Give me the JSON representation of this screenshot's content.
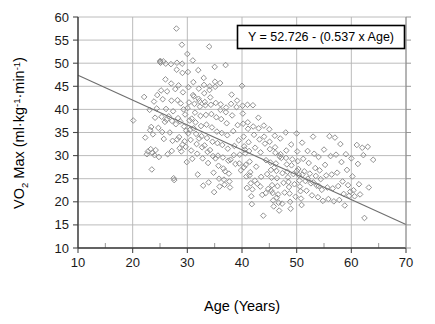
{
  "chart_data": {
    "type": "scatter",
    "title": "",
    "xlabel": "Age (Years)",
    "ylabel": "VO2 Max (ml·kg-1·min-1)",
    "ylabel_parts": {
      "lead": "VO",
      "sub": "2",
      "mid": " Max (ml·kg",
      "sup1": "-1",
      "mid2": "·min",
      "sup2": "-1",
      "tail": ")"
    },
    "xlim": [
      10,
      70
    ],
    "ylim": [
      10,
      60
    ],
    "xticks": [
      10,
      20,
      30,
      40,
      50,
      60,
      70
    ],
    "yticks": [
      10,
      15,
      20,
      25,
      30,
      35,
      40,
      45,
      50,
      55,
      60
    ],
    "xticklabels": [
      "10",
      "20",
      "30",
      "40",
      "50",
      "60",
      "70"
    ],
    "yticklabels": [
      "10",
      "15",
      "20",
      "25",
      "30",
      "35",
      "40",
      "45",
      "50",
      "55",
      "60"
    ],
    "x_minor_tick_step": 5,
    "grid": {
      "x": true,
      "y": true,
      "color": "#b4b4b4"
    },
    "legend": {
      "position": "top-right",
      "boxed": true
    },
    "marker": {
      "shape": "diamond",
      "filled": false,
      "color": "#8a8a8a",
      "size": 5.6
    },
    "annotation": {
      "text": "Y = 52.726 - (0.537 x Age)",
      "intercept": 52.726,
      "slope": -0.537,
      "box": true
    },
    "trendline": {
      "type": "linear",
      "intercept": 52.726,
      "slope": -0.537,
      "x_start": 10,
      "x_end": 70,
      "y_start": 47.4,
      "y_end": 15.1,
      "color": "#6e6e6e"
    },
    "n_points": 343,
    "points": [
      [
        20.1,
        37.6
      ],
      [
        22.1,
        42.7
      ],
      [
        22.3,
        33.9
      ],
      [
        22.6,
        30.3
      ],
      [
        22.8,
        30.9
      ],
      [
        23.1,
        39.9
      ],
      [
        23.2,
        35.5
      ],
      [
        23.3,
        31.4
      ],
      [
        23.4,
        36.2
      ],
      [
        23.5,
        27.0
      ],
      [
        23.6,
        30.6
      ],
      [
        23.7,
        34.6
      ],
      [
        23.9,
        41.7
      ],
      [
        24.0,
        30.1
      ],
      [
        24.1,
        38.2
      ],
      [
        24.2,
        31.2
      ],
      [
        24.4,
        40.2
      ],
      [
        24.5,
        43.1
      ],
      [
        24.7,
        36.0
      ],
      [
        24.8,
        29.7
      ],
      [
        25.0,
        50.3
      ],
      [
        25.1,
        50.1
      ],
      [
        25.2,
        44.1
      ],
      [
        25.3,
        38.4
      ],
      [
        25.4,
        35.1
      ],
      [
        25.5,
        42.2
      ],
      [
        25.6,
        50.4
      ],
      [
        25.7,
        33.6
      ],
      [
        25.9,
        37.3
      ],
      [
        26.0,
        46.5
      ],
      [
        26.1,
        40.1
      ],
      [
        26.2,
        37.8
      ],
      [
        26.3,
        43.9
      ],
      [
        26.4,
        30.3
      ],
      [
        26.6,
        38.5
      ],
      [
        26.8,
        35.0
      ],
      [
        27.0,
        49.8
      ],
      [
        27.1,
        41.9
      ],
      [
        27.2,
        37.5
      ],
      [
        27.3,
        33.2
      ],
      [
        27.4,
        39.6
      ],
      [
        27.5,
        25.1
      ],
      [
        27.6,
        24.7
      ],
      [
        27.8,
        44.4
      ],
      [
        27.9,
        36.8
      ],
      [
        28.0,
        57.5
      ],
      [
        28.1,
        50.1
      ],
      [
        28.2,
        42.0
      ],
      [
        28.3,
        38.1
      ],
      [
        28.4,
        45.2
      ],
      [
        28.5,
        34.0
      ],
      [
        28.6,
        31.6
      ],
      [
        28.7,
        37.4
      ],
      [
        28.8,
        41.3
      ],
      [
        28.9,
        30.9
      ],
      [
        29.0,
        54.0
      ],
      [
        29.1,
        47.9
      ],
      [
        29.2,
        43.7
      ],
      [
        29.3,
        40.0
      ],
      [
        29.4,
        36.3
      ],
      [
        29.5,
        33.1
      ],
      [
        29.6,
        38.9
      ],
      [
        29.7,
        31.9
      ],
      [
        29.8,
        35.4
      ],
      [
        29.9,
        28.6
      ],
      [
        30.0,
        52.0
      ],
      [
        30.1,
        48.1
      ],
      [
        30.2,
        44.8
      ],
      [
        30.3,
        41.5
      ],
      [
        30.4,
        37.6
      ],
      [
        30.5,
        35.6
      ],
      [
        30.6,
        33.4
      ],
      [
        30.7,
        31.1
      ],
      [
        30.8,
        38.0
      ],
      [
        30.9,
        29.3
      ],
      [
        31.0,
        50.6
      ],
      [
        31.1,
        45.9
      ],
      [
        31.2,
        42.8
      ],
      [
        31.3,
        41.2
      ],
      [
        31.4,
        39.3
      ],
      [
        31.5,
        37.2
      ],
      [
        31.6,
        34.7
      ],
      [
        31.7,
        32.5
      ],
      [
        31.8,
        30.4
      ],
      [
        31.9,
        25.9
      ],
      [
        32.0,
        48.5
      ],
      [
        32.1,
        44.5
      ],
      [
        32.2,
        41.8
      ],
      [
        32.3,
        40.6
      ],
      [
        32.4,
        38.6
      ],
      [
        32.5,
        36.4
      ],
      [
        32.6,
        34.2
      ],
      [
        32.7,
        31.8
      ],
      [
        32.8,
        29.4
      ],
      [
        32.9,
        23.5
      ],
      [
        33.0,
        46.8
      ],
      [
        33.1,
        43.5
      ],
      [
        33.2,
        41.6
      ],
      [
        33.3,
        40.9
      ],
      [
        33.4,
        38.8
      ],
      [
        33.5,
        36.7
      ],
      [
        33.6,
        33.8
      ],
      [
        33.7,
        30.8
      ],
      [
        33.8,
        28.4
      ],
      [
        33.9,
        24.2
      ],
      [
        34.0,
        53.6
      ],
      [
        34.1,
        45.0
      ],
      [
        34.2,
        42.6
      ],
      [
        34.3,
        41.0
      ],
      [
        34.4,
        39.0
      ],
      [
        34.5,
        36.1
      ],
      [
        34.6,
        33.0
      ],
      [
        34.7,
        29.9
      ],
      [
        34.8,
        26.3
      ],
      [
        34.9,
        22.1
      ],
      [
        35.0,
        49.2
      ],
      [
        35.1,
        44.9
      ],
      [
        35.2,
        41.4
      ],
      [
        35.3,
        38.3
      ],
      [
        35.4,
        35.2
      ],
      [
        35.5,
        32.7
      ],
      [
        35.6,
        30.0
      ],
      [
        35.7,
        27.8
      ],
      [
        35.8,
        25.0
      ],
      [
        35.9,
        23.3
      ],
      [
        36.0,
        45.7
      ],
      [
        36.1,
        41.1
      ],
      [
        36.2,
        37.9
      ],
      [
        36.3,
        34.9
      ],
      [
        36.4,
        32.3
      ],
      [
        36.5,
        29.6
      ],
      [
        36.6,
        27.2
      ],
      [
        36.7,
        24.8
      ],
      [
        36.8,
        23.7
      ],
      [
        36.9,
        26.6
      ],
      [
        37.0,
        49.6
      ],
      [
        37.1,
        40.4
      ],
      [
        37.2,
        37.0
      ],
      [
        37.3,
        34.4
      ],
      [
        37.4,
        31.5
      ],
      [
        37.5,
        28.9
      ],
      [
        37.6,
        26.1
      ],
      [
        37.7,
        24.4
      ],
      [
        37.8,
        23.1
      ],
      [
        37.9,
        29.1
      ],
      [
        38.0,
        41.2
      ],
      [
        38.2,
        38.7
      ],
      [
        38.4,
        35.3
      ],
      [
        38.6,
        32.1
      ],
      [
        38.8,
        28.2
      ],
      [
        39.0,
        40.5
      ],
      [
        39.2,
        36.6
      ],
      [
        39.4,
        33.3
      ],
      [
        39.6,
        30.2
      ],
      [
        39.8,
        26.8
      ],
      [
        40.0,
        45.1
      ],
      [
        40.1,
        40.8
      ],
      [
        40.2,
        36.9
      ],
      [
        40.3,
        34.1
      ],
      [
        40.4,
        32.0
      ],
      [
        40.5,
        31.3
      ],
      [
        40.6,
        30.5
      ],
      [
        40.7,
        28.0
      ],
      [
        40.8,
        25.5
      ],
      [
        40.9,
        23.0
      ],
      [
        41.0,
        41.0
      ],
      [
        41.1,
        35.8
      ],
      [
        41.2,
        32.9
      ],
      [
        41.3,
        31.0
      ],
      [
        41.4,
        28.7
      ],
      [
        41.5,
        26.4
      ],
      [
        41.6,
        24.0
      ],
      [
        41.7,
        21.2
      ],
      [
        41.8,
        19.5
      ],
      [
        41.9,
        22.7
      ],
      [
        42.0,
        40.9
      ],
      [
        42.2,
        34.5
      ],
      [
        42.4,
        31.7
      ],
      [
        42.6,
        27.6
      ],
      [
        42.8,
        23.9
      ],
      [
        43.0,
        38.2
      ],
      [
        43.2,
        33.5
      ],
      [
        43.4,
        30.7
      ],
      [
        43.5,
        25.4
      ],
      [
        43.7,
        21.5
      ],
      [
        43.9,
        17.0
      ],
      [
        44.0,
        36.5
      ],
      [
        44.2,
        32.6
      ],
      [
        44.4,
        29.0
      ],
      [
        44.6,
        26.0
      ],
      [
        44.8,
        22.8
      ],
      [
        45.0,
        35.7
      ],
      [
        45.1,
        31.4
      ],
      [
        45.2,
        28.5
      ],
      [
        45.3,
        26.9
      ],
      [
        45.4,
        25.2
      ],
      [
        45.5,
        23.6
      ],
      [
        45.6,
        21.9
      ],
      [
        45.7,
        20.3
      ],
      [
        45.8,
        19.0
      ],
      [
        45.9,
        27.4
      ],
      [
        46.0,
        34.3
      ],
      [
        46.1,
        30.6
      ],
      [
        46.2,
        28.3
      ],
      [
        46.3,
        26.7
      ],
      [
        46.4,
        25.1
      ],
      [
        46.5,
        23.4
      ],
      [
        46.6,
        21.6
      ],
      [
        46.7,
        19.8
      ],
      [
        46.8,
        18.1
      ],
      [
        46.9,
        29.8
      ],
      [
        47.0,
        33.7
      ],
      [
        47.2,
        29.5
      ],
      [
        47.4,
        26.2
      ],
      [
        47.6,
        24.1
      ],
      [
        47.8,
        22.0
      ],
      [
        48.0,
        35.0
      ],
      [
        48.1,
        31.1
      ],
      [
        48.2,
        28.1
      ],
      [
        48.3,
        26.5
      ],
      [
        48.4,
        25.3
      ],
      [
        48.5,
        24.3
      ],
      [
        48.6,
        23.2
      ],
      [
        48.7,
        21.8
      ],
      [
        48.8,
        20.0
      ],
      [
        48.9,
        18.5
      ],
      [
        49.0,
        32.4
      ],
      [
        49.2,
        29.2
      ],
      [
        49.4,
        26.0
      ],
      [
        49.6,
        23.8
      ],
      [
        49.8,
        21.1
      ],
      [
        50.0,
        34.8
      ],
      [
        50.1,
        30.9
      ],
      [
        50.2,
        28.8
      ],
      [
        50.3,
        27.1
      ],
      [
        50.4,
        25.8
      ],
      [
        50.5,
        24.6
      ],
      [
        50.6,
        23.3
      ],
      [
        50.7,
        22.3
      ],
      [
        50.8,
        20.7
      ],
      [
        50.9,
        19.3
      ],
      [
        51.0,
        32.8
      ],
      [
        51.2,
        29.3
      ],
      [
        51.4,
        26.6
      ],
      [
        51.6,
        24.5
      ],
      [
        51.8,
        22.4
      ],
      [
        52.0,
        31.0
      ],
      [
        52.2,
        28.4
      ],
      [
        52.4,
        26.1
      ],
      [
        52.6,
        24.0
      ],
      [
        52.8,
        21.4
      ],
      [
        53.0,
        34.1
      ],
      [
        53.2,
        30.4
      ],
      [
        53.4,
        27.3
      ],
      [
        53.5,
        25.6
      ],
      [
        53.7,
        23.5
      ],
      [
        53.9,
        21.0
      ],
      [
        54.0,
        29.7
      ],
      [
        54.2,
        26.8
      ],
      [
        54.4,
        24.9
      ],
      [
        54.6,
        22.6
      ],
      [
        54.8,
        20.2
      ],
      [
        55.0,
        31.3
      ],
      [
        55.2,
        28.0
      ],
      [
        55.4,
        25.7
      ],
      [
        55.6,
        23.1
      ],
      [
        55.8,
        20.6
      ],
      [
        56.0,
        34.2
      ],
      [
        56.2,
        29.9
      ],
      [
        56.4,
        25.9
      ],
      [
        56.6,
        22.9
      ],
      [
        56.8,
        20.1
      ],
      [
        57.0,
        33.9
      ],
      [
        57.2,
        30.2
      ],
      [
        57.4,
        26.3
      ],
      [
        57.6,
        23.4
      ],
      [
        57.8,
        20.4
      ],
      [
        58.0,
        32.5
      ],
      [
        58.2,
        28.6
      ],
      [
        58.4,
        24.4
      ],
      [
        58.6,
        21.7
      ],
      [
        58.8,
        19.2
      ],
      [
        59.0,
        30.3
      ],
      [
        59.2,
        26.9
      ],
      [
        59.4,
        23.6
      ],
      [
        59.6,
        21.3
      ],
      [
        59.8,
        22.2
      ],
      [
        60.0,
        29.4
      ],
      [
        60.2,
        25.5
      ],
      [
        60.4,
        22.5
      ],
      [
        60.6,
        21.2
      ],
      [
        61.0,
        32.3
      ],
      [
        61.2,
        28.2
      ],
      [
        61.4,
        23.8
      ],
      [
        61.6,
        21.6
      ],
      [
        62.0,
        31.7
      ],
      [
        62.2,
        30.1
      ],
      [
        62.4,
        16.5
      ],
      [
        63.0,
        31.9
      ],
      [
        63.2,
        23.1
      ],
      [
        64.0,
        29.1
      ],
      [
        38.1,
        43.2
      ],
      [
        39.1,
        41.9
      ],
      [
        35.05,
        46.0
      ],
      [
        33.05,
        45.3
      ],
      [
        30.05,
        40.3
      ],
      [
        31.05,
        43.1
      ],
      [
        29.05,
        49.9
      ],
      [
        28.05,
        48.6
      ],
      [
        27.05,
        45.6
      ],
      [
        26.05,
        49.9
      ],
      [
        25.05,
        50.5
      ],
      [
        32.05,
        42.3
      ],
      [
        34.05,
        44.2
      ],
      [
        36.05,
        39.9
      ],
      [
        37.05,
        39.4
      ],
      [
        40.15,
        39.1
      ],
      [
        41.05,
        37.2
      ],
      [
        43.05,
        35.9
      ],
      [
        44.05,
        34.1
      ],
      [
        45.05,
        33.0
      ],
      [
        42.05,
        36.3
      ],
      [
        46.05,
        31.8
      ],
      [
        47.05,
        30.3
      ],
      [
        48.05,
        29.5
      ],
      [
        49.05,
        27.9
      ],
      [
        50.05,
        26.7
      ],
      [
        51.05,
        25.9
      ],
      [
        52.05,
        25.0
      ],
      [
        53.05,
        24.2
      ],
      [
        54.05,
        23.4
      ],
      [
        30.15,
        34.8
      ],
      [
        31.15,
        35.9
      ],
      [
        32.15,
        33.7
      ],
      [
        33.15,
        32.2
      ],
      [
        34.15,
        31.2
      ],
      [
        35.15,
        29.4
      ],
      [
        29.15,
        32.4
      ],
      [
        28.15,
        33.5
      ],
      [
        27.15,
        31.0
      ],
      [
        38.5,
        30.1
      ],
      [
        39.5,
        28.3
      ],
      [
        40.35,
        27.5
      ],
      [
        41.35,
        25.7
      ],
      [
        42.35,
        24.6
      ],
      [
        43.35,
        23.3
      ],
      [
        44.35,
        21.9
      ],
      [
        45.35,
        22.4
      ],
      [
        46.35,
        20.9
      ],
      [
        47.35,
        19.6
      ]
    ]
  }
}
